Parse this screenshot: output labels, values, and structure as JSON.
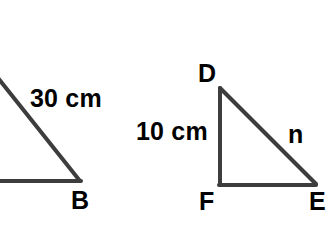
{
  "figure": {
    "background_color": "#ffffff",
    "stroke_color": "#3d3d3d",
    "text_color": "#000000",
    "stroke_width": 4
  },
  "left_triangle": {
    "name": "triangle-ab-partial",
    "note_visible": "partially cropped at left edge of image",
    "vertices": {
      "top_left_offscreen": [
        0,
        80
      ],
      "bottom_right_B": [
        80,
        180
      ],
      "bottom_left_offscreen": [
        0,
        180
      ]
    },
    "labels": {
      "hypotenuse_length": "30 cm",
      "vertex_b": "B"
    }
  },
  "right_triangle": {
    "name": "triangle-DFE",
    "vertices": {
      "D": [
        220,
        88
      ],
      "F": [
        220,
        185
      ],
      "E": [
        315,
        185
      ]
    },
    "labels": {
      "vertex_d": "D",
      "vertex_f": "F",
      "vertex_e": "E",
      "leg_df_length": "10 cm",
      "hypotenuse_de_label": "n"
    }
  }
}
